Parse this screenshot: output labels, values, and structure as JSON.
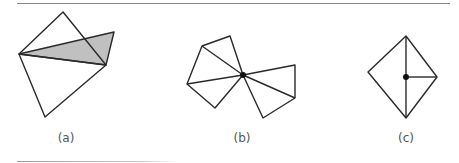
{
  "figure": {
    "panels": [
      {
        "id": "a",
        "label": "(a)",
        "label_x": 66
      },
      {
        "id": "b",
        "label": "(b)",
        "label_x": 242
      },
      {
        "id": "c",
        "label": "(c)",
        "label_x": 406
      }
    ],
    "colors": {
      "stroke": "#2a2a2a",
      "shade": "#c0c0c0",
      "rule": "#888888",
      "label": "#555555"
    }
  }
}
